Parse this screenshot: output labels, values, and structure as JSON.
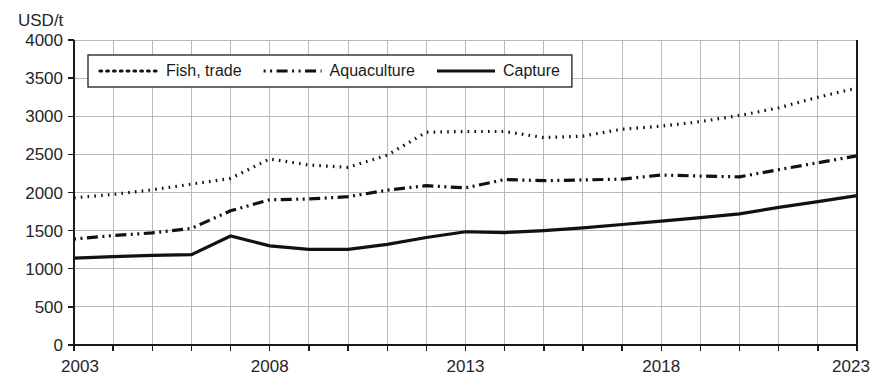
{
  "chart_data": {
    "type": "line",
    "title": "",
    "subtitle": "",
    "xlabel": "",
    "ylabel": "USD/t",
    "unit_label": "USD/t",
    "xlim": [
      2003,
      2023
    ],
    "ylim": [
      0,
      4000
    ],
    "y_ticks": [
      0,
      500,
      1000,
      1500,
      2000,
      2500,
      3000,
      3500,
      4000
    ],
    "y_tick_labels": [
      "0",
      "500",
      "1000",
      "1500",
      "2000",
      "2500",
      "3000",
      "3500",
      "4000"
    ],
    "x": [
      2003,
      2004,
      2005,
      2006,
      2007,
      2008,
      2009,
      2010,
      2011,
      2012,
      2013,
      2014,
      2015,
      2016,
      2017,
      2018,
      2019,
      2020,
      2021,
      2022,
      2023
    ],
    "x_tick_labels": [
      "2003",
      "2008",
      "2013",
      "2018",
      "2023"
    ],
    "x_ticks_labeled": [
      2003,
      2008,
      2013,
      2018,
      2023
    ],
    "grid": true,
    "grid_x": true,
    "grid_y": true,
    "legend_position": "top-left-inside",
    "series": [
      {
        "name": "Fish, trade",
        "style": "dotted",
        "color": "#111111",
        "values": [
          1930,
          1975,
          2035,
          2110,
          2185,
          2440,
          2360,
          2330,
          2490,
          2790,
          2800,
          2800,
          2720,
          2740,
          2830,
          2870,
          2930,
          3010,
          3110,
          3250,
          3370
        ]
      },
      {
        "name": "Aquaculture",
        "style": "dash-dot",
        "color": "#111111",
        "values": [
          1390,
          1435,
          1470,
          1530,
          1760,
          1905,
          1915,
          1945,
          2030,
          2090,
          2060,
          2170,
          2155,
          2165,
          2175,
          2230,
          2215,
          2205,
          2300,
          2390,
          2480
        ]
      },
      {
        "name": "Capture",
        "style": "solid",
        "color": "#111111",
        "values": [
          1140,
          1160,
          1175,
          1185,
          1430,
          1300,
          1255,
          1255,
          1320,
          1410,
          1485,
          1475,
          1500,
          1535,
          1580,
          1625,
          1670,
          1720,
          1805,
          1880,
          1960
        ]
      }
    ]
  },
  "legend": {
    "items": [
      {
        "label": "Fish, trade",
        "style": "dotted"
      },
      {
        "label": "Aquaculture",
        "style": "dash-dot"
      },
      {
        "label": "Capture",
        "style": "solid"
      }
    ]
  },
  "colors": {
    "line": "#111111",
    "grid": "#b9b9b9",
    "axis": "#1a1a1a",
    "background": "#ffffff",
    "text": "#262626"
  }
}
